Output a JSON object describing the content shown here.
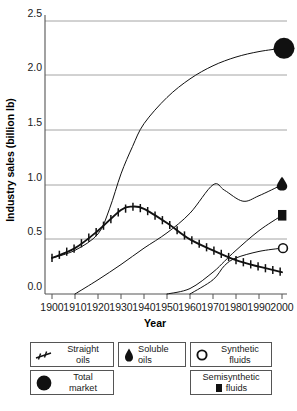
{
  "chart_data": {
    "type": "line",
    "title": "",
    "xlabel": "Year",
    "ylabel": "Industry sales (billion lb)",
    "xlim": [
      1895,
      2004
    ],
    "ylim": [
      -0.12,
      2.5
    ],
    "xticks": [
      1900,
      1910,
      1920,
      1930,
      1940,
      1950,
      1960,
      1970,
      1980,
      1990,
      2000
    ],
    "xticklabels": [
      "1900",
      "1910",
      "1920",
      "1930",
      "1940",
      "1950",
      "1960",
      "1970",
      "1980",
      "1990",
      "2000"
    ],
    "yticks": [
      0.0,
      0.5,
      1.0,
      1.5,
      2.0,
      2.5
    ],
    "yticklabels": [
      "0.0",
      "0.5",
      "1.0",
      "1.5",
      "2.0",
      "2.5"
    ],
    "grid": "horizontal",
    "legend_position": "below",
    "series": [
      {
        "name": "Total market",
        "marker": "filled-circle",
        "marker_end_value": 2.25,
        "x": [
          1900,
          1910,
          1920,
          1925,
          1930,
          1935,
          1940,
          1950,
          1960,
          1970,
          1980,
          1990,
          2000
        ],
        "values": [
          0.33,
          0.4,
          0.55,
          0.78,
          1.1,
          1.35,
          1.56,
          1.8,
          1.97,
          2.09,
          2.17,
          2.22,
          2.25
        ]
      },
      {
        "name": "Straight oils",
        "marker": "plus-ticks",
        "x": [
          1900,
          1910,
          1920,
          1930,
          1935,
          1940,
          1950,
          1960,
          1970,
          1980,
          1990,
          2000
        ],
        "values": [
          0.33,
          0.42,
          0.58,
          0.77,
          0.8,
          0.78,
          0.65,
          0.5,
          0.4,
          0.31,
          0.25,
          0.2
        ]
      },
      {
        "name": "Soluble oils",
        "marker": "droplet",
        "marker_end_value": 1.0,
        "x": [
          1910,
          1920,
          1930,
          1940,
          1950,
          1960,
          1970,
          1975,
          1983,
          1990,
          2000
        ],
        "values": [
          0.0,
          0.13,
          0.27,
          0.42,
          0.56,
          0.74,
          1.0,
          0.95,
          0.85,
          0.9,
          1.0
        ]
      },
      {
        "name": "Semisynthetic fluids",
        "marker": "filled-square",
        "marker_end_value": 0.72,
        "x": [
          1950,
          1960,
          1970,
          1975,
          1980,
          1990,
          2000
        ],
        "values": [
          0.0,
          0.05,
          0.2,
          0.3,
          0.4,
          0.58,
          0.72
        ]
      },
      {
        "name": "Synthetic fluids",
        "marker": "open-circle",
        "marker_end_value": 0.42,
        "x": [
          1960,
          1970,
          1975,
          1980,
          1990,
          2000
        ],
        "values": [
          0.0,
          0.13,
          0.26,
          0.33,
          0.39,
          0.42
        ]
      }
    ]
  },
  "axes": {
    "y_title": "Industry sales (billion lb)",
    "x_title": "Year",
    "y_labels": [
      "2.5",
      "2.0",
      "1.5",
      "1.0",
      "0.5",
      "0.0"
    ],
    "x_labels": [
      "1900",
      "1910",
      "1920",
      "1930",
      "1940",
      "1950",
      "1960",
      "1970",
      "1980",
      "1990",
      "2000"
    ]
  },
  "legend": {
    "items": [
      {
        "label_line1": "Straight",
        "label_line2": "oils",
        "marker": "plus-ticks-icon"
      },
      {
        "label_line1": "Soluble oils",
        "label_line2": "",
        "marker": "droplet-icon"
      },
      {
        "label_line1": "Synthetic",
        "label_line2": "fluids",
        "marker": "open-circle-icon"
      },
      {
        "label_line1": "Total",
        "label_line2": "market",
        "marker": "filled-circle-icon"
      },
      {
        "label_line1": "Semisynthetic",
        "label_line2": "fluids",
        "marker": "filled-square-icon"
      }
    ]
  },
  "colors": {
    "ink": "#1a1a1a",
    "grid": "#9a9a9a",
    "axis": "#555555",
    "background": "#ffffff"
  }
}
